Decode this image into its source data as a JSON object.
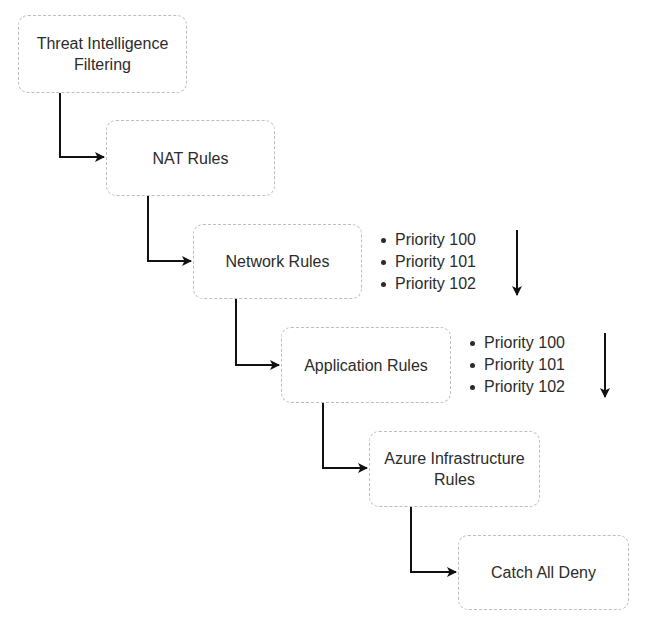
{
  "diagram": {
    "type": "flow",
    "nodes": [
      {
        "id": "threat-intel",
        "lines": [
          "Threat Intelligence",
          "Filtering"
        ]
      },
      {
        "id": "nat",
        "lines": [
          "NAT Rules"
        ]
      },
      {
        "id": "network",
        "lines": [
          "Network Rules"
        ]
      },
      {
        "id": "application",
        "lines": [
          "Application Rules"
        ]
      },
      {
        "id": "azure-infra",
        "lines": [
          "Azure Infrastructure",
          "Rules"
        ]
      },
      {
        "id": "catch-all",
        "lines": [
          "Catch All Deny"
        ]
      }
    ],
    "edges": [
      {
        "from": "threat-intel",
        "to": "nat"
      },
      {
        "from": "nat",
        "to": "network"
      },
      {
        "from": "network",
        "to": "application"
      },
      {
        "from": "application",
        "to": "azure-infra"
      },
      {
        "from": "azure-infra",
        "to": "catch-all"
      }
    ],
    "annotations": {
      "network": {
        "items": [
          "Priority 100",
          "Priority 101",
          "Priority 102"
        ],
        "arrow": "down"
      },
      "application": {
        "items": [
          "Priority 100",
          "Priority 101",
          "Priority 102"
        ],
        "arrow": "down"
      }
    },
    "colors": {
      "box_border": "#bdbdbd",
      "text": "#2b2b2b",
      "arrow": "#111111"
    }
  }
}
